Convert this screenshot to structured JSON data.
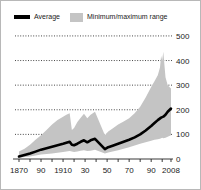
{
  "figure": {
    "background_color": "#ffffff",
    "border_color": "#b8b8b8"
  },
  "legend": {
    "position": "top",
    "items": [
      {
        "label": "Average",
        "marker": "line-swatch",
        "color": "#000000"
      },
      {
        "label": "Minimum/maximum range",
        "marker": "box-swatch",
        "color": "#c4c4c4"
      }
    ]
  },
  "chart_data": {
    "type": "area",
    "title": "",
    "subtitle": "",
    "xlabel": "",
    "ylabel": "",
    "grid": true,
    "grid_style": "dotted",
    "legend_position": "top",
    "xlim": [
      1870,
      2008
    ],
    "ylim": [
      0,
      520
    ],
    "yticks": [
      0,
      100,
      200,
      300,
      400,
      500
    ],
    "ytick_labels": [
      "0",
      "100",
      "200",
      "300",
      "400",
      "500"
    ],
    "xticks": [
      1870,
      1890,
      1910,
      1930,
      1950,
      1970,
      1990,
      2008
    ],
    "xtick_labels": [
      "1870",
      "90",
      "1910",
      "30",
      "50",
      "70",
      "90",
      "2008"
    ],
    "xtick_minor": [
      1880,
      1900,
      1920,
      1940,
      1960,
      1980,
      2000
    ],
    "data_gap": [
      1939,
      1948
    ],
    "series": [
      {
        "name": "Minimum/maximum range",
        "type": "band",
        "color": "#c4c4c4",
        "x": [
          1870,
          1875,
          1880,
          1885,
          1890,
          1895,
          1900,
          1905,
          1910,
          1913,
          1916,
          1918,
          1920,
          1923,
          1926,
          1929,
          1932,
          1935,
          1939,
          1948,
          1951,
          1955,
          1960,
          1965,
          1970,
          1975,
          1980,
          1985,
          1990,
          1993,
          1996,
          1998,
          1999,
          2000,
          2001,
          2003,
          2005,
          2008
        ],
        "min": [
          5,
          8,
          10,
          14,
          18,
          20,
          22,
          25,
          28,
          30,
          32,
          30,
          28,
          30,
          34,
          36,
          32,
          34,
          38,
          22,
          26,
          30,
          36,
          42,
          48,
          55,
          62,
          68,
          74,
          78,
          80,
          82,
          84,
          86,
          84,
          86,
          90,
          96
        ],
        "max": [
          30,
          42,
          58,
          78,
          96,
          118,
          140,
          158,
          172,
          180,
          186,
          118,
          126,
          150,
          168,
          184,
          166,
          180,
          192,
          96,
          112,
          124,
          140,
          152,
          166,
          186,
          212,
          250,
          292,
          316,
          340,
          372,
          418,
          400,
          436,
          332,
          300,
          286
        ]
      },
      {
        "name": "Average",
        "type": "line",
        "color": "#000000",
        "x": [
          1870,
          1875,
          1880,
          1885,
          1890,
          1895,
          1900,
          1905,
          1910,
          1913,
          1916,
          1918,
          1920,
          1923,
          1926,
          1929,
          1932,
          1935,
          1939,
          1948,
          1951,
          1955,
          1960,
          1965,
          1970,
          1975,
          1980,
          1985,
          1990,
          1993,
          1996,
          1999,
          2001,
          2003,
          2005,
          2008
        ],
        "y": [
          10,
          16,
          22,
          30,
          38,
          44,
          50,
          56,
          62,
          66,
          70,
          58,
          56,
          62,
          70,
          76,
          68,
          76,
          82,
          40,
          48,
          54,
          62,
          70,
          78,
          88,
          100,
          116,
          134,
          146,
          158,
          168,
          172,
          180,
          192,
          205
        ]
      }
    ]
  }
}
